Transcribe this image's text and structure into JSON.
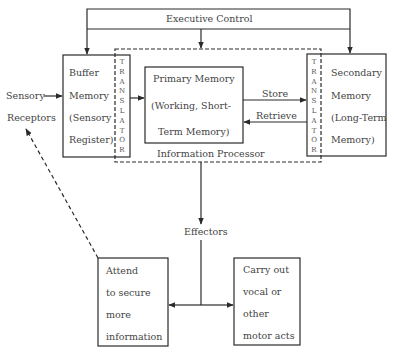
{
  "diagram": {
    "executive_control": "Executive Control",
    "sensory_receptors": [
      "Sensory",
      "Receptors"
    ],
    "buffer_memory": [
      "Buffer",
      "Memory",
      "(Sensory",
      "Register)"
    ],
    "translator": [
      "T",
      "R",
      "A",
      "N",
      "S",
      "L",
      "A",
      "T",
      "O",
      "R"
    ],
    "primary_memory": [
      "Primary Memory",
      "(Working, Short-",
      "Term Memory)"
    ],
    "store": "Store",
    "retrieve": "Retrieve",
    "secondary_memory": [
      "Secondary",
      "Memory",
      "(Long-Term",
      "Memory)"
    ],
    "information_processor": "Information Processor",
    "effectors": "Effectors",
    "attend": [
      "Attend",
      "to secure",
      "more",
      "information"
    ],
    "carry_out": [
      "Carry out",
      "vocal or",
      "other",
      "motor acts"
    ]
  },
  "colors": {
    "line": "#2a2a2a",
    "text": "#444444"
  }
}
